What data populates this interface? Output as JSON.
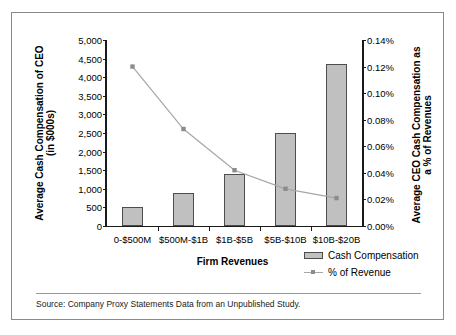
{
  "figure": {
    "source_note": "Source: Company Proxy Statements Data from an Unpublished Study."
  },
  "chart_data": {
    "type": "bar",
    "title": "",
    "categories": [
      "0-$500M",
      "$500M-$1B",
      "$1B-$5B",
      "$5B-$10B",
      "$10B-$20B"
    ],
    "xlabel": "Firm Revenues",
    "ylabel": "Average Cash Compensation of CEO (in $000s)",
    "ylabel_line1": "Average Cash Compensation of CEO",
    "ylabel_line2": "(in $000s)",
    "ylabel_right": "Average CEO Cash Compensation as a % of Revenues",
    "ylabel_right_line1": "Average CEO Cash Compensation as",
    "ylabel_right_line2": "a % of Revenues",
    "ylim": [
      0,
      5000
    ],
    "ylim_right": [
      0,
      0.14
    ],
    "yticks": [
      0,
      500,
      1000,
      1500,
      2000,
      2500,
      3000,
      3500,
      4000,
      4500,
      5000
    ],
    "ytick_labels": [
      "0",
      "500",
      "1,000",
      "1,500",
      "2,000",
      "2,500",
      "3,000",
      "3,500",
      "4,000",
      "4,500",
      "5,000"
    ],
    "yticks_right": [
      0.0,
      0.02,
      0.04,
      0.06,
      0.08,
      0.1,
      0.12,
      0.14
    ],
    "ytick_labels_right": [
      "0.00%",
      "0.02%",
      "0.04%",
      "0.06%",
      "0.08%",
      "0.10%",
      "0.12%",
      "0.14%"
    ],
    "grid": false,
    "legend_position": "bottom-right",
    "series": [
      {
        "name": "Cash Compensation",
        "type": "bar",
        "axis": "left",
        "color": "#c0c0c0",
        "edge_color": "#4d4d4d",
        "values": [
          500,
          900,
          1400,
          2500,
          4350
        ]
      },
      {
        "name": "% of Revenue",
        "type": "line",
        "axis": "right",
        "color": "#a6a6a6",
        "marker_color": "#8c8c8c",
        "values": [
          0.12,
          0.073,
          0.042,
          0.028,
          0.021
        ]
      }
    ]
  }
}
